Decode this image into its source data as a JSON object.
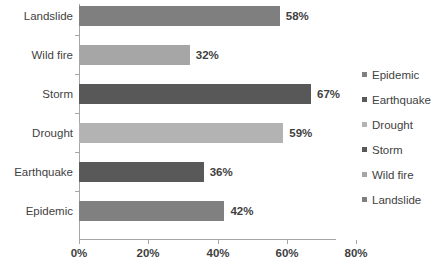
{
  "chart_data": {
    "type": "bar",
    "orientation": "horizontal",
    "title": "",
    "xlabel": "",
    "ylabel": "",
    "categories": [
      "Epidemic",
      "Earthquake",
      "Drought",
      "Storm",
      "Wild fire",
      "Landslide"
    ],
    "values": [
      42,
      36,
      59,
      67,
      32,
      58
    ],
    "data_labels": [
      "42%",
      "36%",
      "59%",
      "67%",
      "32%",
      "58%"
    ],
    "colors": [
      "#808080",
      "#595959",
      "#b3b3b3",
      "#585858",
      "#a6a6a6",
      "#7f7f7f"
    ],
    "xlim": [
      0,
      80
    ],
    "xticks": [
      0,
      20,
      40,
      60,
      80
    ],
    "xtick_labels": [
      "0%",
      "20%",
      "40%",
      "60%",
      "80%"
    ],
    "grid": false,
    "legend_position": "right",
    "legend_entries": [
      {
        "label": "Epidemic",
        "color": "#808080"
      },
      {
        "label": "Earthquake",
        "color": "#595959"
      },
      {
        "label": "Drought",
        "color": "#b3b3b3"
      },
      {
        "label": "Storm",
        "color": "#585858"
      },
      {
        "label": "Wild fire",
        "color": "#a6a6a6"
      },
      {
        "label": "Landslide",
        "color": "#7f7f7f"
      }
    ],
    "bars_top_to_bottom": [
      {
        "category": "Landslide",
        "value": 58,
        "label": "58%",
        "color": "#7f7f7f"
      },
      {
        "category": "Wild fire",
        "value": 32,
        "label": "32%",
        "color": "#a6a6a6"
      },
      {
        "category": "Storm",
        "value": 67,
        "label": "67%",
        "color": "#585858"
      },
      {
        "category": "Drought",
        "value": 59,
        "label": "59%",
        "color": "#b3b3b3"
      },
      {
        "category": "Earthquake",
        "value": 36,
        "label": "36%",
        "color": "#595959"
      },
      {
        "category": "Epidemic",
        "value": 42,
        "label": "42%",
        "color": "#808080"
      }
    ]
  }
}
